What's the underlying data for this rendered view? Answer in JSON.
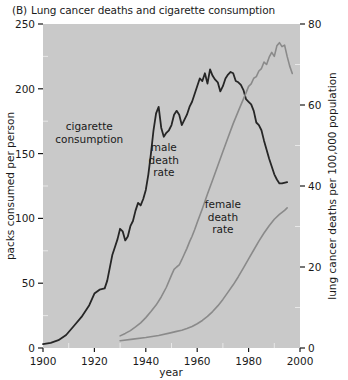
{
  "figure": {
    "panel_tag": "(B)",
    "title": "Lung cancer deaths and cigarette consumption"
  },
  "chart_data": {
    "type": "line",
    "xlabel": "year",
    "ylabel": "packs consumed per person",
    "y2label": "lung cancer deaths per 100,000 population",
    "xlim": [
      1900,
      2000
    ],
    "ylim": [
      0,
      250
    ],
    "y2lim": [
      0,
      80
    ],
    "xticks": [
      1900,
      1920,
      1940,
      1960,
      1980,
      2000
    ],
    "xtick_labels": [
      "1900",
      "1920",
      "1940",
      "1960",
      "1980",
      "2000"
    ],
    "yticks": [
      0,
      50,
      100,
      150,
      200,
      250
    ],
    "ytick_labels": [
      "0",
      "50",
      "100",
      "150",
      "200",
      "250"
    ],
    "y2ticks": [
      0,
      20,
      40,
      60,
      80
    ],
    "y2tick_labels": [
      "0",
      "20",
      "40",
      "60",
      "80"
    ],
    "xminor_step": 10,
    "yminor_step": 25,
    "y2minor_step": 10,
    "grid": false,
    "legend": "inline-annotations",
    "plot_bg": "#c9c9c9",
    "annotations": [
      {
        "name": "cigarette-consumption-label",
        "text": "cigarette\nconsumption",
        "x": 1918,
        "y": 168,
        "axis": "left"
      },
      {
        "name": "male-death-rate-label",
        "text": "male\ndeath\nrate",
        "x": 1947,
        "y": 152,
        "axis": "left"
      },
      {
        "name": "female-death-rate-label",
        "text": "female\ndeath\nrate",
        "x": 1970,
        "y": 108,
        "axis": "left"
      }
    ],
    "series": [
      {
        "name": "cigarette consumption",
        "axis": "left",
        "color": "#262626",
        "width": 1.8,
        "unit": "packs consumed per person",
        "points": [
          [
            1900,
            3
          ],
          [
            1903,
            4
          ],
          [
            1906,
            6
          ],
          [
            1909,
            10
          ],
          [
            1912,
            17
          ],
          [
            1915,
            24
          ],
          [
            1918,
            33
          ],
          [
            1920,
            42
          ],
          [
            1922,
            45
          ],
          [
            1924,
            46
          ],
          [
            1925,
            52
          ],
          [
            1926,
            62
          ],
          [
            1927,
            72
          ],
          [
            1928,
            78
          ],
          [
            1929,
            84
          ],
          [
            1930,
            92
          ],
          [
            1931,
            90
          ],
          [
            1932,
            83
          ],
          [
            1933,
            86
          ],
          [
            1934,
            94
          ],
          [
            1935,
            98
          ],
          [
            1936,
            106
          ],
          [
            1937,
            112
          ],
          [
            1938,
            110
          ],
          [
            1939,
            115
          ],
          [
            1940,
            122
          ],
          [
            1941,
            134
          ],
          [
            1942,
            150
          ],
          [
            1943,
            168
          ],
          [
            1944,
            181
          ],
          [
            1945,
            186
          ],
          [
            1946,
            170
          ],
          [
            1947,
            163
          ],
          [
            1948,
            166
          ],
          [
            1949,
            168
          ],
          [
            1950,
            172
          ],
          [
            1951,
            180
          ],
          [
            1952,
            183
          ],
          [
            1953,
            180
          ],
          [
            1954,
            172
          ],
          [
            1955,
            176
          ],
          [
            1956,
            180
          ],
          [
            1957,
            186
          ],
          [
            1958,
            190
          ],
          [
            1959,
            196
          ],
          [
            1960,
            202
          ],
          [
            1961,
            208
          ],
          [
            1962,
            206
          ],
          [
            1963,
            212
          ],
          [
            1964,
            204
          ],
          [
            1965,
            215
          ],
          [
            1966,
            210
          ],
          [
            1967,
            207
          ],
          [
            1968,
            205
          ],
          [
            1969,
            198
          ],
          [
            1970,
            202
          ],
          [
            1971,
            208
          ],
          [
            1972,
            211
          ],
          [
            1973,
            213
          ],
          [
            1974,
            212
          ],
          [
            1975,
            206
          ],
          [
            1976,
            205
          ],
          [
            1977,
            203
          ],
          [
            1978,
            199
          ],
          [
            1979,
            192
          ],
          [
            1980,
            190
          ],
          [
            1981,
            188
          ],
          [
            1982,
            183
          ],
          [
            1983,
            174
          ],
          [
            1984,
            172
          ],
          [
            1985,
            168
          ],
          [
            1986,
            160
          ],
          [
            1987,
            153
          ],
          [
            1988,
            146
          ],
          [
            1989,
            140
          ],
          [
            1990,
            134
          ],
          [
            1991,
            130
          ],
          [
            1992,
            127
          ],
          [
            1993,
            127
          ],
          [
            1995,
            128
          ]
        ]
      },
      {
        "name": "male death rate",
        "axis": "right",
        "color": "#8a8a8a",
        "width": 1.6,
        "unit": "lung cancer deaths per 100,000 population",
        "points": [
          [
            1930,
            3
          ],
          [
            1932,
            3.6
          ],
          [
            1934,
            4.3
          ],
          [
            1936,
            5.2
          ],
          [
            1938,
            6.2
          ],
          [
            1940,
            7.5
          ],
          [
            1942,
            9.0
          ],
          [
            1944,
            10.6
          ],
          [
            1946,
            12.6
          ],
          [
            1948,
            15.0
          ],
          [
            1950,
            18.0
          ],
          [
            1951,
            19.4
          ],
          [
            1952,
            20.0
          ],
          [
            1953,
            20.5
          ],
          [
            1954,
            21.8
          ],
          [
            1955,
            23.2
          ],
          [
            1956,
            24.6
          ],
          [
            1957,
            26.2
          ],
          [
            1958,
            27.6
          ],
          [
            1959,
            29.2
          ],
          [
            1960,
            31.0
          ],
          [
            1962,
            34.4
          ],
          [
            1964,
            38.0
          ],
          [
            1966,
            41.5
          ],
          [
            1968,
            45.0
          ],
          [
            1970,
            48.5
          ],
          [
            1972,
            52.0
          ],
          [
            1974,
            55.4
          ],
          [
            1976,
            58.5
          ],
          [
            1978,
            61.5
          ],
          [
            1979,
            63.0
          ],
          [
            1980,
            64.6
          ],
          [
            1981,
            65.2
          ],
          [
            1982,
            66.6
          ],
          [
            1983,
            67.0
          ],
          [
            1984,
            68.4
          ],
          [
            1985,
            69.0
          ],
          [
            1986,
            70.6
          ],
          [
            1987,
            70.0
          ],
          [
            1988,
            71.8
          ],
          [
            1989,
            73.0
          ],
          [
            1990,
            72.0
          ],
          [
            1991,
            74.6
          ],
          [
            1992,
            75.4
          ],
          [
            1993,
            74.4
          ],
          [
            1994,
            74.8
          ],
          [
            1995,
            72.0
          ],
          [
            1996,
            69.6
          ],
          [
            1997,
            67.8
          ]
        ]
      },
      {
        "name": "female death rate",
        "axis": "right",
        "color": "#8a8a8a",
        "width": 1.6,
        "unit": "lung cancer deaths per 100,000 population",
        "points": [
          [
            1930,
            1.8
          ],
          [
            1935,
            2.2
          ],
          [
            1940,
            2.6
          ],
          [
            1945,
            3.1
          ],
          [
            1950,
            3.8
          ],
          [
            1952,
            4.1
          ],
          [
            1954,
            4.4
          ],
          [
            1956,
            4.8
          ],
          [
            1958,
            5.3
          ],
          [
            1960,
            6.0
          ],
          [
            1962,
            6.8
          ],
          [
            1964,
            7.8
          ],
          [
            1966,
            9.0
          ],
          [
            1968,
            10.4
          ],
          [
            1970,
            12.0
          ],
          [
            1972,
            13.8
          ],
          [
            1974,
            15.6
          ],
          [
            1976,
            17.6
          ],
          [
            1978,
            19.8
          ],
          [
            1980,
            22.0
          ],
          [
            1982,
            24.2
          ],
          [
            1984,
            26.4
          ],
          [
            1986,
            28.4
          ],
          [
            1988,
            30.2
          ],
          [
            1990,
            31.8
          ],
          [
            1992,
            33.0
          ],
          [
            1994,
            34.0
          ],
          [
            1995,
            34.6
          ]
        ]
      }
    ]
  }
}
